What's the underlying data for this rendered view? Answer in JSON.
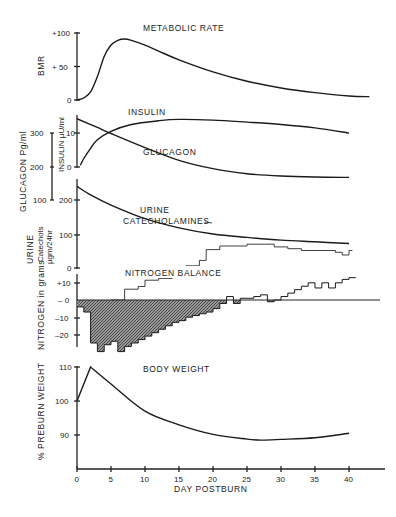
{
  "figure": {
    "xaxis_label": "DAY POSTBURN",
    "xticks": [
      "0",
      "5",
      "10",
      "15",
      "20",
      "25",
      "30",
      "35",
      "40"
    ],
    "panels": {
      "bmr": {
        "title": "METABOLIC RATE",
        "ylabel": "BMR",
        "ticks": [
          "+100",
          "+ 50",
          "0"
        ]
      },
      "hormones": {
        "insulin_label": "INSULIN",
        "glucagon_label": "GLUCAGON",
        "catechol_label_1": "URINE",
        "catechol_label_2": "CATECHOLAMINES",
        "insulin_ylabel": "INSULIN µU/ml",
        "glucagon_ylabel": "GLUCAGON  Pg/ml",
        "catechol_ylabel_1": "URINE",
        "catechol_ylabel_2": "Catechols",
        "catechol_ylabel_3": "µgm/24hr",
        "insulin_ticks": [
          "10",
          "0"
        ],
        "glucagon_ticks": [
          "300",
          "200",
          "100"
        ],
        "catechol_ticks": [
          "200",
          "100",
          "0"
        ]
      },
      "nitrogen": {
        "title": "NITROGEN BALANCE",
        "ylabel": "NITROGEN in grams",
        "ticks": [
          "+10",
          "– 0",
          "–10",
          "–20"
        ]
      },
      "weight": {
        "title": "BODY WEIGHT",
        "ylabel": "% PREBURN WEIGHT",
        "ticks": [
          "110",
          "100",
          "90"
        ]
      }
    }
  },
  "chart_data": [
    {
      "type": "line",
      "title": "METABOLIC RATE",
      "xlabel": "DAY POSTBURN",
      "ylabel": "BMR (% above normal)",
      "ylim": [
        0,
        100
      ],
      "x": [
        0,
        1,
        2,
        3,
        4,
        5,
        6,
        7,
        8,
        10,
        12,
        15,
        20,
        25,
        30,
        35,
        40,
        43
      ],
      "values": [
        0,
        3,
        12,
        35,
        65,
        82,
        89,
        91,
        89,
        82,
        73,
        60,
        42,
        28,
        18,
        11,
        6,
        5
      ]
    },
    {
      "type": "line",
      "title": "INSULIN",
      "ylabel": "INSULIN µU/ml",
      "ylim": [
        0,
        15
      ],
      "x": [
        0.5,
        1,
        2,
        3,
        5,
        8,
        12,
        15,
        20,
        25,
        30,
        35,
        40
      ],
      "values": [
        0.5,
        2.5,
        5.5,
        8,
        10.5,
        12.5,
        13.6,
        14,
        13.8,
        13.2,
        12.5,
        11.5,
        10
      ]
    },
    {
      "type": "line",
      "title": "GLUCAGON",
      "ylabel": "GLUCAGON Pg/ml",
      "ylim": [
        100,
        350
      ],
      "x": [
        0,
        3,
        5,
        10,
        15,
        20,
        25,
        30,
        35,
        40
      ],
      "values": [
        344,
        318,
        300,
        258,
        220,
        195,
        180,
        173,
        170,
        169
      ]
    },
    {
      "type": "line",
      "title": "URINE CATECHOLAMINES",
      "ylabel": "Catechols µgm/24hr",
      "ylim": [
        0,
        200
      ],
      "x": [
        0,
        2,
        5,
        10,
        15,
        20,
        25,
        30,
        35,
        40
      ],
      "values": [
        240,
        215,
        185,
        145,
        118,
        100,
        90,
        82,
        77,
        72
      ]
    },
    {
      "type": "line",
      "title": "URINE CATECHOLS (daily steps)",
      "ylabel": "Catechols µgm/24hr",
      "x": [
        5,
        7,
        9,
        10,
        12,
        14,
        15,
        16,
        18,
        19,
        21,
        25,
        29,
        31,
        33,
        35,
        38,
        39,
        40
      ],
      "values": [
        0,
        12,
        15,
        22,
        24,
        30,
        32,
        38,
        44,
        56,
        60,
        62,
        59,
        57,
        55,
        55,
        53,
        50,
        55
      ]
    },
    {
      "type": "area",
      "title": "NITROGEN BALANCE",
      "ylabel": "NITROGEN in grams",
      "ylim": [
        -27,
        15
      ],
      "x": [
        0,
        1,
        2,
        3,
        4,
        5,
        6,
        7,
        8,
        9,
        10,
        11,
        12,
        13,
        14,
        15,
        16,
        17,
        18,
        19,
        20,
        21,
        22,
        23,
        24,
        25,
        26,
        27,
        28,
        29,
        30,
        31,
        32,
        33,
        34,
        35,
        36,
        37,
        38,
        39,
        40
      ],
      "values": [
        -4,
        -7,
        -25,
        -30,
        -26,
        -24,
        -30,
        -27,
        -25,
        -23,
        -21,
        -19,
        -17,
        -15,
        -13,
        -12,
        -10,
        -9,
        -8,
        -7,
        -5,
        -2,
        2,
        -2,
        1,
        1,
        2,
        3,
        -1,
        0,
        2,
        4,
        6,
        8,
        10,
        7,
        10,
        7,
        10,
        12,
        13
      ]
    },
    {
      "type": "line",
      "title": "BODY WEIGHT",
      "xlabel": "DAY POSTBURN",
      "ylabel": "% PREBURN WEIGHT",
      "ylim": [
        80,
        110
      ],
      "x": [
        0,
        2,
        5,
        10,
        15,
        20,
        25,
        27,
        30,
        35,
        40
      ],
      "values": [
        100,
        110,
        105,
        97,
        93,
        90.2,
        88.8,
        88.5,
        88.7,
        89.2,
        90.5
      ]
    }
  ]
}
